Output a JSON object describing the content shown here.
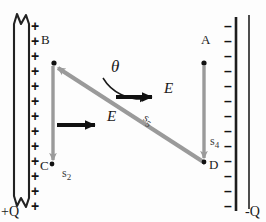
{
  "figure": {
    "type": "physics-field-diagram",
    "width": 266,
    "height": 222,
    "background": "#fdfdfd",
    "ink_color": "#1a1a1a",
    "vector_gray": "#9a9a9a"
  },
  "plates": {
    "left": {
      "name": "positive-plate",
      "charge_label": "+Q",
      "sign_symbol": "+",
      "sign_count": 13,
      "has_break_symbol": true,
      "x": 22,
      "top": 16,
      "bottom": 212
    },
    "right": {
      "name": "negative-plate",
      "charge_label": "-Q",
      "sign_symbol": "–",
      "sign_count": 13,
      "has_break_symbol": false,
      "x": 236,
      "top": 16,
      "bottom": 212
    }
  },
  "points": [
    {
      "id": "A",
      "label": "A",
      "dot_x": 204,
      "dot_y": 63,
      "label_x": 201,
      "label_y": 33
    },
    {
      "id": "B",
      "label": "B",
      "dot_x": 54,
      "dot_y": 63,
      "label_x": 41,
      "label_y": 33
    },
    {
      "id": "C",
      "label": "C",
      "dot_x": 52,
      "dot_y": 165,
      "label_x": 40,
      "label_y": 160
    },
    {
      "id": "D",
      "label": "D",
      "dot_x": 204,
      "dot_y": 163,
      "label_x": 209,
      "label_y": 159
    }
  ],
  "displacement_vectors": [
    {
      "name": "s2",
      "symbol": "s",
      "subscript": "2",
      "from": "B",
      "to": "C",
      "x1": 53,
      "y1": 66,
      "x2": 53,
      "y2": 166,
      "color": "#9a9a9a",
      "label_x": 62,
      "label_y": 166,
      "label_rotation": 0
    },
    {
      "name": "s4",
      "symbol": "s",
      "subscript": "4",
      "from": "A",
      "to": "D",
      "x1": 204,
      "y1": 66,
      "x2": 204,
      "y2": 164,
      "color": "#9a9a9a",
      "label_x": 211,
      "label_y": 134,
      "label_rotation": 0
    },
    {
      "name": "s5",
      "symbol": "s",
      "subscript": "5",
      "from": "D",
      "to": "B",
      "x1": 204,
      "y1": 162,
      "x2": 55,
      "y2": 66,
      "color": "#9a9a9a",
      "label_x": 152,
      "label_y": 112,
      "label_rotation": 33
    }
  ],
  "field_vectors": [
    {
      "name": "E-upper",
      "symbol": "E",
      "x1": 116,
      "y1": 97,
      "x2": 160,
      "y2": 97,
      "color": "#111111",
      "label_x": 164,
      "label_y": 81
    },
    {
      "name": "E-lower",
      "symbol": "E",
      "x1": 57,
      "y1": 125,
      "x2": 103,
      "y2": 125,
      "color": "#111111",
      "label_x": 108,
      "label_y": 109
    }
  ],
  "angle": {
    "name": "theta",
    "symbol": "θ",
    "label_x": 112,
    "label_y": 60,
    "description": "angle between s5 and E"
  },
  "vector_arrow_glyph": "→"
}
